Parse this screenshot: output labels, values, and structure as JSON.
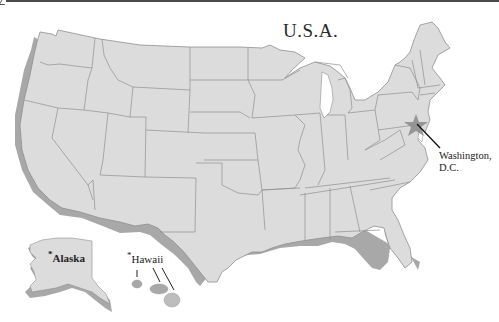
{
  "map": {
    "title": "U.S.A.",
    "capital": {
      "name_line1": "Washington,",
      "name_line2": "D.C.",
      "marker": "star-icon"
    },
    "insets": [
      {
        "name": "Alaska",
        "marker": "*"
      },
      {
        "name": "Hawaii",
        "marker": "*"
      }
    ],
    "colors": {
      "land": "#dcdcdc",
      "border": "#8f8f8f",
      "shadow": "#a8a8a8",
      "star": "#8a8a8a",
      "text": "#222222",
      "background": "#ffffff"
    }
  }
}
